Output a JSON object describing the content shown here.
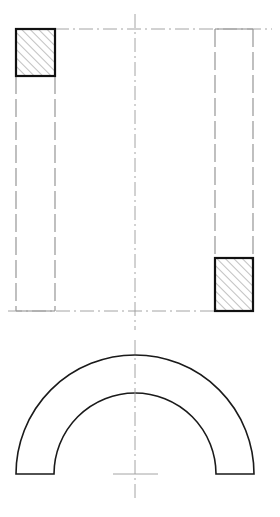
{
  "canvas": {
    "width": 280,
    "height": 517,
    "background": "#ffffff",
    "title": "180-degree pipe bend engineering drawing"
  },
  "style": {
    "line_color": "#1a1a1a",
    "hidden_line_color": "#8c8c8c",
    "center_line_color": "#9a9a9a",
    "hatch_color": "#4d4d4d",
    "section_outline_color": "#111111",
    "visible_line_width": 1.6,
    "hidden_line_width": 1.1,
    "center_line_width": 0.9,
    "hatch_line_width": 0.7,
    "hatch_spacing": 6,
    "hatch_angle_deg": 45,
    "hidden_dash_pattern": "18 5",
    "center_dash_pattern": "14 4 2 4"
  },
  "views": {
    "elevation": {
      "name": "front-elevation-section",
      "label": "Front elevation (sectioned)",
      "bounds": {
        "x": 16,
        "y": 29,
        "width": 237,
        "height": 282
      },
      "center_x": 135,
      "top_y": 29,
      "bottom_y": 311,
      "left_leg": {
        "name": "left-leg",
        "x_left": 16,
        "x_right": 55,
        "y_top": 29,
        "y_bottom": 311,
        "line_type": "hidden"
      },
      "right_leg": {
        "name": "right-leg",
        "x_left": 215,
        "x_right": 253,
        "y_top": 29,
        "y_bottom": 311,
        "line_type": "hidden"
      },
      "sections": [
        {
          "name": "left-top-section",
          "position": "top-left",
          "x": 16,
          "y": 29,
          "width": 39,
          "height": 47,
          "hatched": true,
          "outline": "solid"
        },
        {
          "name": "right-bottom-section",
          "position": "bottom-right",
          "x": 215,
          "y": 258,
          "width": 38,
          "height": 53,
          "hatched": true,
          "outline": "solid"
        }
      ],
      "center_lines": [
        {
          "name": "vertical-center-line",
          "orientation": "vertical",
          "x": 135,
          "y1": 14,
          "y2": 330
        },
        {
          "name": "top-horizontal-center-line",
          "orientation": "horizontal",
          "y": 29,
          "x1": 55,
          "x2": 272
        },
        {
          "name": "bottom-horizontal-center-line",
          "orientation": "horizontal",
          "y": 311,
          "x1": 8,
          "x2": 232
        }
      ]
    },
    "plan": {
      "name": "plan-view-half-annulus",
      "label": "Plan view - 180 degree bend",
      "center_x": 135,
      "center_y": 474,
      "outer_radius": 119,
      "inner_radius": 81,
      "start_angle_deg": 180,
      "end_angle_deg": 0,
      "outer_left_x": 16,
      "inner_left_x": 54,
      "inner_right_x": 216,
      "outer_right_x": 254,
      "flat_end_y": 474,
      "outer_top_y": 355,
      "inner_top_y": 393,
      "center_lines": [
        {
          "name": "plan-vertical-center-line",
          "orientation": "vertical",
          "x": 135,
          "y1": 340,
          "y2": 500
        },
        {
          "name": "plan-horizontal-center-tick",
          "orientation": "horizontal",
          "y": 474,
          "x1": 113,
          "x2": 158
        }
      ]
    }
  }
}
